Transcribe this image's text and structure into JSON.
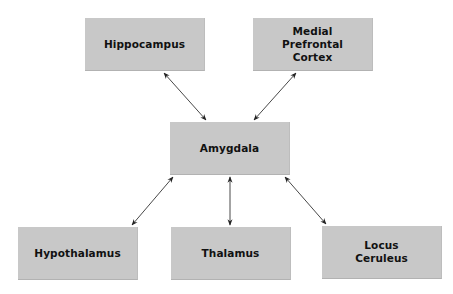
{
  "diagram": {
    "colors": {
      "node_fill": "#c8c8c8",
      "text": "#111111",
      "arrow": "#333333",
      "background": "#ffffff"
    },
    "nodes": {
      "hippocampus": {
        "label": "Hippocampus",
        "x": 85,
        "y": 18
      },
      "mpfc": {
        "label": "Medial\nPrefrontal\nCortex",
        "x": 253,
        "y": 18
      },
      "amygdala": {
        "label": "Amygdala",
        "x": 170,
        "y": 122
      },
      "hypothalamus": {
        "label": "Hypothalamus",
        "x": 18,
        "y": 227
      },
      "thalamus": {
        "label": "Thalamus",
        "x": 171,
        "y": 227
      },
      "locus": {
        "label": "Locus\nCeruleus",
        "x": 322,
        "y": 226
      }
    },
    "edges": [
      {
        "from": "hippocampus",
        "to": "amygdala",
        "type": "bidirectional"
      },
      {
        "from": "mpfc",
        "to": "amygdala",
        "type": "bidirectional"
      },
      {
        "from": "amygdala",
        "to": "hypothalamus",
        "type": "bidirectional"
      },
      {
        "from": "amygdala",
        "to": "thalamus",
        "type": "bidirectional"
      },
      {
        "from": "amygdala",
        "to": "locus",
        "type": "bidirectional"
      }
    ]
  }
}
